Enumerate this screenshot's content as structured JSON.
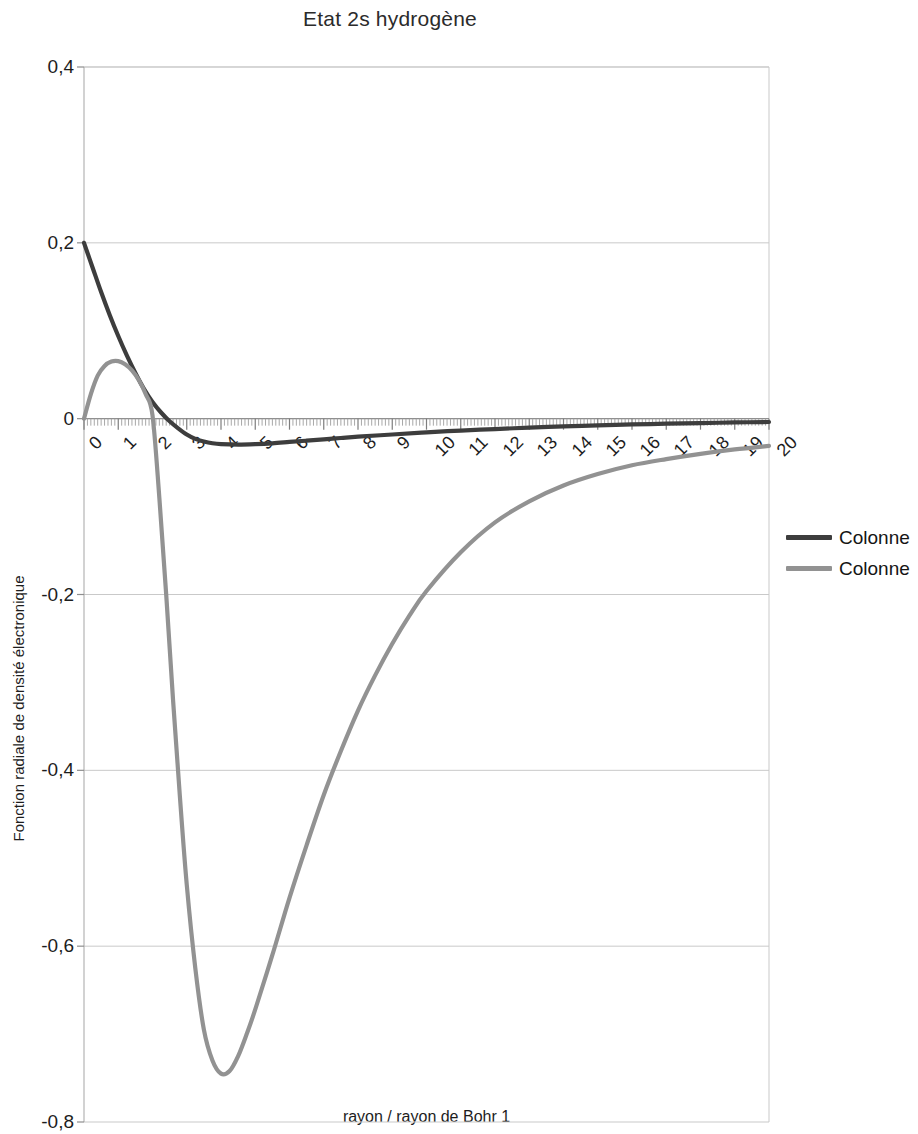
{
  "chart_data": {
    "type": "line",
    "title": "Etat 2s hydrogène",
    "xlabel": "rayon / rayon de Bohr 1",
    "ylabel": "Fonction radiale de densité électronique",
    "xlim": [
      0,
      20
    ],
    "ylim": [
      -0.8,
      0.4
    ],
    "grid": true,
    "legend_position": "right",
    "x_ticks": [
      "0",
      "1",
      "2",
      "3",
      "4",
      "5",
      "6",
      "7",
      "8",
      "9",
      "10",
      "11",
      "12",
      "13",
      "14",
      "15",
      "16",
      "17",
      "18",
      "19",
      "20"
    ],
    "y_ticks": [
      "0,4",
      "0,2",
      "0",
      "-0,2",
      "-0,4",
      "-0,6",
      "-0,8"
    ],
    "y_tick_values": [
      0.4,
      0.2,
      0,
      -0.2,
      -0.4,
      -0.6,
      -0.8
    ],
    "colors": {
      "series1": "#3d3d3d",
      "series2": "#929292",
      "grid": "#c9c9c9",
      "axis": "#b4b4b4"
    },
    "series": [
      {
        "name": "Colonne",
        "color": "#3d3d3d",
        "x": [
          0,
          0.25,
          0.5,
          0.75,
          1,
          1.25,
          1.5,
          1.75,
          2,
          2.25,
          2.5,
          2.75,
          3,
          3.25,
          3.5,
          3.75,
          4,
          4.5,
          5,
          5.5,
          6,
          6.5,
          7,
          7.5,
          8,
          9,
          10,
          11,
          12,
          13,
          14,
          15,
          16,
          17,
          18,
          19,
          20
        ],
        "values": [
          0.2,
          0.172,
          0.144,
          0.118,
          0.094,
          0.072,
          0.052,
          0.034,
          0.019,
          0.007,
          -0.003,
          -0.011,
          -0.018,
          -0.023,
          -0.026,
          -0.028,
          -0.029,
          -0.0295,
          -0.029,
          -0.028,
          -0.0265,
          -0.025,
          -0.0235,
          -0.022,
          -0.0205,
          -0.018,
          -0.0155,
          -0.0135,
          -0.0118,
          -0.0102,
          -0.0088,
          -0.0076,
          -0.0066,
          -0.0057,
          -0.005,
          -0.0043,
          -0.0038
        ]
      },
      {
        "name": "Colonne",
        "color": "#929292",
        "x": [
          0,
          0.2,
          0.4,
          0.6,
          0.8,
          1,
          1.2,
          1.4,
          1.6,
          1.8,
          2,
          2.2,
          2.4,
          2.6,
          2.8,
          3,
          3.25,
          3.5,
          3.75,
          4,
          4.25,
          4.5,
          4.75,
          5,
          5.5,
          6,
          6.5,
          7,
          7.5,
          8,
          8.5,
          9,
          9.5,
          10,
          11,
          12,
          13,
          14,
          15,
          16,
          17,
          18,
          19,
          20
        ],
        "values": [
          0,
          0.028,
          0.049,
          0.06,
          0.065,
          0.0655,
          0.062,
          0.055,
          0.044,
          0.028,
          0.004,
          -0.09,
          -0.2,
          -0.32,
          -0.43,
          -0.53,
          -0.625,
          -0.695,
          -0.73,
          -0.745,
          -0.742,
          -0.725,
          -0.7,
          -0.672,
          -0.61,
          -0.545,
          -0.485,
          -0.428,
          -0.378,
          -0.332,
          -0.292,
          -0.256,
          -0.224,
          -0.196,
          -0.152,
          -0.118,
          -0.094,
          -0.076,
          -0.063,
          -0.053,
          -0.046,
          -0.04,
          -0.035,
          -0.031
        ]
      }
    ]
  },
  "legend": {
    "items": [
      {
        "label": "Colonne",
        "color": "#3d3d3d"
      },
      {
        "label": "Colonne",
        "color": "#929292"
      }
    ]
  }
}
